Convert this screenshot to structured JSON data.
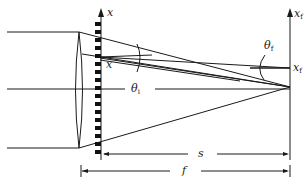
{
  "diagram": {
    "type": "optics",
    "labels": {
      "grating_axis": "x",
      "grating_point": "x",
      "focal_axis": "x",
      "focal_axis_sub": "f",
      "focal_point": "x",
      "focal_point_sub": "f",
      "theta_i": "θ",
      "theta_i_sub": "i",
      "theta_f": "θ",
      "theta_f_sub": "f",
      "distance_s": "s",
      "distance_f": "f"
    },
    "colors": {
      "line": "#1a1a1a",
      "background": "#ffffff"
    },
    "grating_teeth_count": 17
  }
}
